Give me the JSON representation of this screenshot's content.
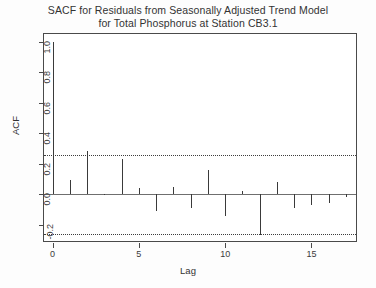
{
  "chart_data": {
    "type": "bar",
    "title": "SACF for Residuals from Seasonally Adjusted Trend Model for Total Phosphorus at Station CB3.1",
    "title_lines": [
      "SACF for Residuals from Seasonally Adjusted Trend Model",
      "for Total Phosphorus at Station CB3.1"
    ],
    "xlabel": "Lag",
    "ylabel": "ACF",
    "xlim": [
      -0.5,
      17.7
    ],
    "ylim": [
      -0.32,
      1.05
    ],
    "grid": false,
    "legend": null,
    "xticks": [
      0,
      5,
      10,
      15
    ],
    "xtick_labels": [
      "0",
      "5",
      "10",
      "15"
    ],
    "yticks": [
      1.0,
      0.8,
      0.6,
      0.4,
      0.2,
      0.0,
      -0.2
    ],
    "ytick_labels": [
      "1.0",
      "0.8",
      "0.6",
      "0.4",
      "0.2",
      "0.0",
      "-0.2"
    ],
    "confidence_bands": [
      0.26,
      -0.26
    ],
    "x": [
      0,
      1,
      2,
      3,
      4,
      5,
      6,
      7,
      8,
      9,
      10,
      11,
      12,
      13,
      14,
      15,
      16,
      17
    ],
    "values": [
      1.0,
      0.09,
      0.28,
      0.0,
      0.23,
      0.04,
      -0.11,
      0.05,
      -0.09,
      0.16,
      -0.14,
      0.02,
      -0.27,
      0.08,
      -0.09,
      -0.07,
      -0.06,
      -0.02
    ],
    "categories": [
      "0",
      "1",
      "2",
      "3",
      "4",
      "5",
      "6",
      "7",
      "8",
      "9",
      "10",
      "11",
      "12",
      "13",
      "14",
      "15",
      "16",
      "17"
    ],
    "series": [
      {
        "name": "ACF",
        "values": [
          1.0,
          0.09,
          0.28,
          0.0,
          0.23,
          0.04,
          -0.11,
          0.05,
          -0.09,
          0.16,
          -0.14,
          0.02,
          -0.27,
          0.08,
          -0.09,
          -0.07,
          -0.06,
          -0.02
        ]
      }
    ]
  },
  "colors": {
    "spike": "#3a3a3a",
    "axis": "#4a4a4a",
    "confidence": "#3d3d3d",
    "background": "#ffffff"
  }
}
